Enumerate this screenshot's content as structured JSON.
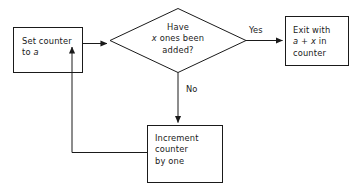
{
  "diagram": {
    "background_color": "#ffffff",
    "stroke_color": "#1a1a1a",
    "text_color": "#1a1a1a"
  },
  "nodes": {
    "set_counter": {
      "shape": "rectangle",
      "line1": "Set counter",
      "line2_prefix": "to ",
      "line2_var": "a"
    },
    "decision": {
      "shape": "diamond",
      "line1": "Have",
      "line2_var": "x",
      "line2_rest": " ones been",
      "line3": "added?"
    },
    "exit": {
      "shape": "rectangle",
      "line1": "Exit with",
      "line2_var_a": "a",
      "line2_mid": " + ",
      "line2_var_x": "x",
      "line2_rest": " in",
      "line3": "counter"
    },
    "increment": {
      "shape": "rectangle",
      "line1": "Increment",
      "line2": "counter",
      "line3": "by one"
    }
  },
  "edges": {
    "yes_label": "Yes",
    "no_label": "No"
  }
}
